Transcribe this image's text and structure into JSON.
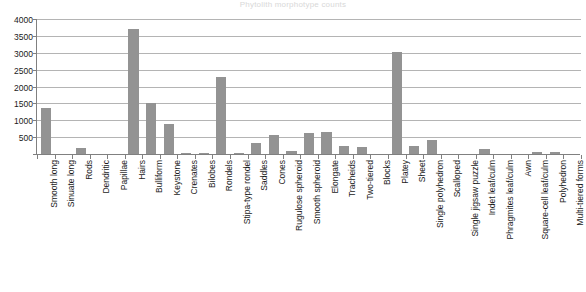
{
  "chart_data": {
    "type": "bar",
    "title": "Phytolith morphotype counts",
    "xlabel": "",
    "ylabel": "",
    "ylim": [
      0,
      4000
    ],
    "ytick_step": 500,
    "yticks": [
      "0",
      "500",
      "1000",
      "1500",
      "2000",
      "2500",
      "3000",
      "3500",
      "4000"
    ],
    "grid": true,
    "legend": "none",
    "bar_color": "#939393",
    "axis_color": "#808080",
    "gridline_color": "#b4b4b4",
    "categories": [
      "Smooth long",
      "Sinuate long",
      "Rods",
      "Dendritic",
      "Papillae",
      "Hairs",
      "Bulliform",
      "Keystone",
      "Crenates",
      "Bilobes",
      "Rondels",
      "Stipa-type rondel",
      "Saddles",
      "Cones",
      "Rugulose spheroid",
      "Smooth spheroid",
      "Elongate",
      "Tracheids",
      "Two-tiered",
      "Blocks",
      "Platey",
      "Sheet",
      "Single polyhedron",
      "Scalloped",
      "Single jigsaw puzzle",
      "Indet leaf/culm",
      "Phragmites leaf/culm",
      "Awn",
      "Square-cell leaf/culm",
      "Polyhedron",
      "Multi-tiered forms"
    ],
    "values": [
      1350,
      0,
      180,
      0,
      0,
      3700,
      1500,
      880,
      30,
      40,
      2270,
      20,
      330,
      560,
      80,
      620,
      660,
      250,
      200,
      0,
      3020,
      240,
      430,
      0,
      0,
      140,
      0,
      0,
      50,
      50,
      0
    ]
  }
}
